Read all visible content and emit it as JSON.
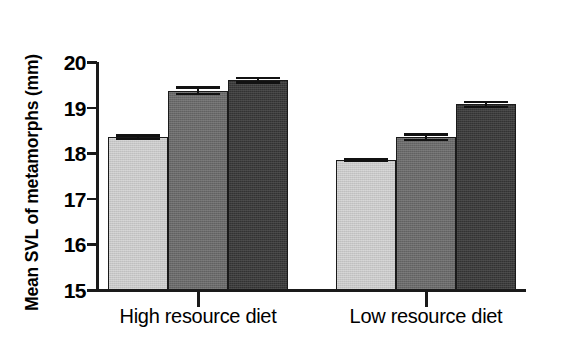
{
  "chart_data": {
    "type": "bar",
    "title": "",
    "xlabel": "",
    "ylabel": "Mean SVL of metamorphs (mm)",
    "ylim": [
      15,
      20
    ],
    "yticks": [
      15,
      16,
      17,
      18,
      19,
      20
    ],
    "ytick_labels": [
      "15",
      "16",
      "17",
      "18",
      "19",
      "20"
    ],
    "grid": false,
    "legend": "none",
    "categories": [
      "High resource diet",
      "Low resource diet"
    ],
    "series": [
      {
        "name": "Treatment 1",
        "shade": "light",
        "color": "#d2d2d2",
        "values": [
          18.35,
          17.85
        ],
        "errors": [
          0.07,
          0.05
        ]
      },
      {
        "name": "Treatment 2",
        "shade": "medium",
        "color": "#6b6b6b",
        "values": [
          19.37,
          18.35
        ],
        "errors": [
          0.1,
          0.09
        ]
      },
      {
        "name": "Treatment 3",
        "shade": "dark",
        "color": "#383838",
        "values": [
          19.6,
          19.07
        ],
        "errors": [
          0.08,
          0.08
        ]
      }
    ],
    "bars": [
      {
        "group": "High resource diet",
        "series": "Treatment 1",
        "shade": "light",
        "value": 18.35,
        "error": 0.07
      },
      {
        "group": "High resource diet",
        "series": "Treatment 2",
        "shade": "medium",
        "value": 19.37,
        "error": 0.1
      },
      {
        "group": "High resource diet",
        "series": "Treatment 3",
        "shade": "dark",
        "value": 19.6,
        "error": 0.08
      },
      {
        "group": "Low resource diet",
        "series": "Treatment 1",
        "shade": "light",
        "value": 17.85,
        "error": 0.05
      },
      {
        "group": "Low resource diet",
        "series": "Treatment 2",
        "shade": "medium",
        "value": 18.35,
        "error": 0.09
      },
      {
        "group": "Low resource diet",
        "series": "Treatment 3",
        "shade": "dark",
        "value": 19.07,
        "error": 0.08
      }
    ],
    "colors": {
      "light": "#d2d2d2",
      "medium": "#6b6b6b",
      "dark": "#383838",
      "axis": "#1a1a1a",
      "background": "#ffffff"
    }
  }
}
